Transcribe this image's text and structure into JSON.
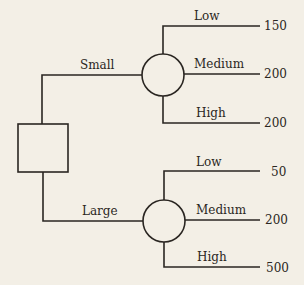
{
  "diagram": {
    "type": "decision-tree",
    "decision_branches": [
      {
        "label": "Small",
        "outcomes": [
          {
            "label": "Low",
            "value": "150"
          },
          {
            "label": "Medium",
            "value": "200"
          },
          {
            "label": "High",
            "value": "200"
          }
        ]
      },
      {
        "label": "Large",
        "outcomes": [
          {
            "label": "Low",
            "value": "50"
          },
          {
            "label": "Medium",
            "value": "200"
          },
          {
            "label": "High",
            "value": "500"
          }
        ]
      }
    ]
  }
}
